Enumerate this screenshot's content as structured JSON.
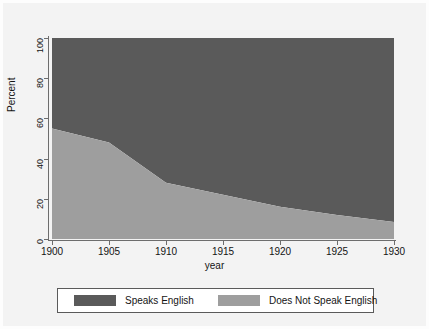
{
  "chart_data": {
    "type": "area",
    "stacked": true,
    "title": "",
    "subtitle": "",
    "xlabel": "year",
    "ylabel": "Percent",
    "xlim": [
      1900,
      1930
    ],
    "ylim": [
      0,
      100
    ],
    "xticks": [
      1900,
      1905,
      1910,
      1915,
      1920,
      1925,
      1930
    ],
    "xtick_labels": [
      "1900",
      "1905",
      "1910",
      "1915",
      "1920",
      "1925",
      "1930"
    ],
    "yticks": [
      0,
      20,
      40,
      60,
      80,
      100
    ],
    "ytick_labels": [
      "0",
      "20",
      "40",
      "60",
      "80",
      "100"
    ],
    "grid": false,
    "legend_position": "bottom",
    "x": [
      1900,
      1905,
      1910,
      1915,
      1920,
      1925,
      1930
    ],
    "series": [
      {
        "name": "Does Not Speak English",
        "color": "#9e9e9e",
        "values": [
          55,
          48,
          28,
          22,
          16,
          12,
          8.5
        ]
      },
      {
        "name": "Speaks English",
        "color": "#5a5a5a",
        "values": [
          45,
          52,
          72,
          78,
          84,
          88,
          91.5
        ]
      }
    ]
  },
  "axes": {
    "y_title": "Percent",
    "x_title": "year"
  },
  "legend": {
    "entries": [
      {
        "label": "Speaks English",
        "color": "#5a5a5a"
      },
      {
        "label": "Does Not Speak English",
        "color": "#9e9e9e"
      }
    ]
  },
  "colors": {
    "background": "#f3f3f3",
    "plot_background": "#ffffff",
    "speaks_english": "#5a5a5a",
    "does_not_speak_english": "#9e9e9e",
    "axis": "#6d6d6d",
    "text": "#141414"
  }
}
